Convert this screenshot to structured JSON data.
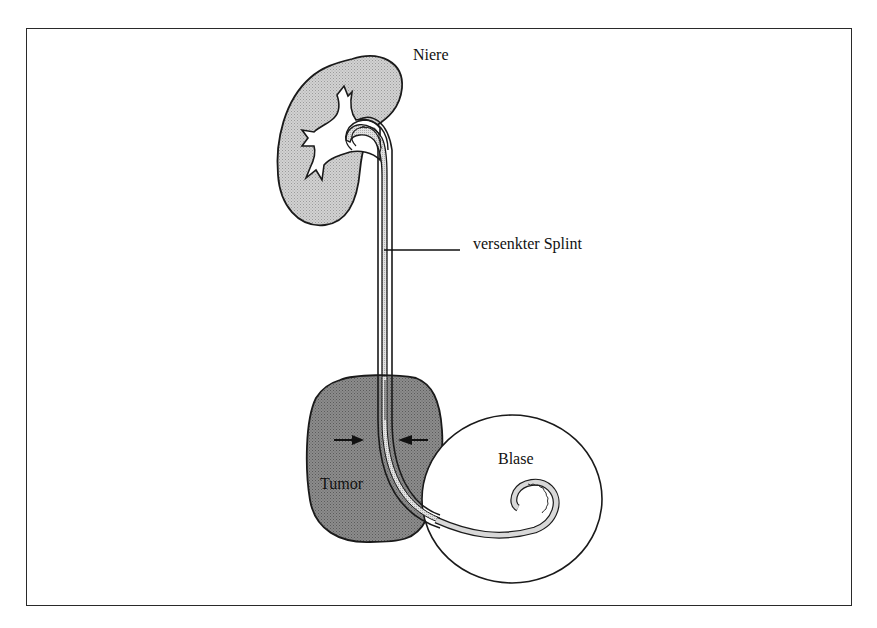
{
  "diagram": {
    "labels": {
      "kidney": "Niere",
      "splint": "versenkter Splint",
      "bladder": "Blase",
      "tumor": "Tumor"
    },
    "colors": {
      "kidney_fill": "#c4c4c4",
      "tumor_fill": "#8a8a8a",
      "bladder_fill": "#ffffff",
      "outline": "#1a1a1a",
      "splint_fill": "#d8d8d8",
      "frame": "#2a2a2a"
    },
    "elements": [
      {
        "name": "kidney",
        "label": "Niere"
      },
      {
        "name": "ureter-with-splint",
        "label": "versenkter Splint"
      },
      {
        "name": "tumor",
        "label": "Tumor",
        "annotation": "compression arrows pointing toward ureter"
      },
      {
        "name": "bladder",
        "label": "Blase"
      }
    ]
  }
}
